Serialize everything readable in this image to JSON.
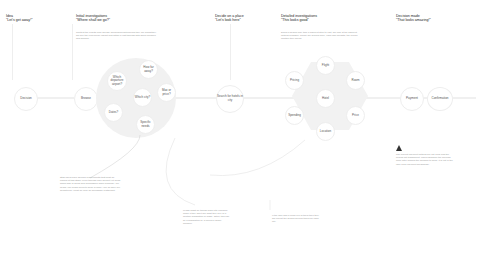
{
  "stages": [
    {
      "id": "idea",
      "title": "Idea",
      "quote": "\"Let's get away!\"",
      "description": ""
    },
    {
      "id": "initial",
      "title": "Initial investigations",
      "quote": "\"Where shall we go?\"",
      "description": "Content the results from already decided/predetermined they are going/they will see the experience impact and within a visit through with good inclusion and families."
    },
    {
      "id": "decide",
      "title": "Decide on a place",
      "quote": "\"Let's look here\"",
      "description": ""
    },
    {
      "id": "detailed",
      "title": "Detailed investigations",
      "quote": "\"This looks good\"",
      "description": "Doing a search may take a different step to visit, will look at the different options available. These are around price, each own weights, the overall location they would."
    },
    {
      "id": "decision",
      "title": "Decision made",
      "quote": "\"That looks amazing!\"",
      "description": ""
    }
  ],
  "flow": {
    "decision": "Decision",
    "browse": "Browse",
    "search": "Search for hotels in city",
    "payment": "Payment",
    "confirmation": "Confirmation"
  },
  "initial_cluster": {
    "nodes": [
      "How far away?",
      "Which departure airport?",
      "Which city?",
      "Max or price?",
      "Dates?",
      "Specific needs"
    ]
  },
  "detailed_cluster": {
    "center": "Hotel",
    "nodes": [
      "Flight",
      "Pricing",
      "Room",
      "Spending",
      "Price",
      "Location"
    ]
  },
  "notes": {
    "browse_note": "Staff users have specific requirements that must be fulfilled at this stage (even through offer doesn't yet know which side is going and commission when booking). We heard \"We heard much to book a room\" \"We all have our departures\" \"Must be near an accessible restaurant\"",
    "initial_note": "Leads might be thrown back into research mode if they don't like what they see or if another suggestion is made. Often, this can be a suggestion by a friend or family member.",
    "search_note": "If the user had a clean run of them then they will repeat the search several times for each city.",
    "decision_note": "The current payment options are not clear and the pricing not transparent. Users abandon the process more after making the decision to book. It is not in the user clear payment breakdown."
  },
  "icons": {
    "warning": "warning-triangle-icon"
  },
  "colors": {
    "cluster_bg": "#f1f1f1",
    "node_border": "#eeeeee",
    "text_dark": "#222222",
    "text_muted": "#999999"
  }
}
